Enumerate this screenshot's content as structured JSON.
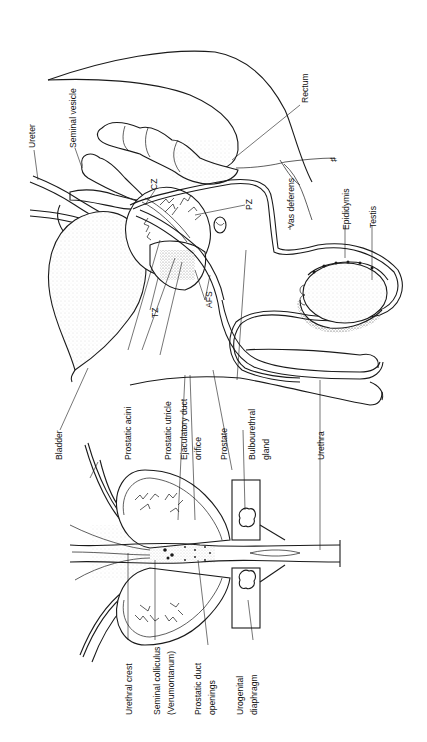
{
  "figure": {
    "orientation_deg": -90,
    "colors": {
      "line": "#1a1a1a",
      "background": "#ffffff",
      "stipple": "#555555"
    }
  },
  "labels": {
    "ureter": "Ureter",
    "seminal_vesicle": "Seminal vesicle",
    "cz": "CZ",
    "pz": "PZ",
    "tz": "TZ",
    "afs": "AFS",
    "rectum": "Rectum",
    "vas_deferens": "Vas deferens",
    "epididymis": "Epididymis",
    "testis": "Testis",
    "bladder": "Bladder",
    "prostatic_acini": "Prostatic acini",
    "prostatic_utricle": "Prostatic utricle",
    "ejaculatory_duct": "Ejaculatory duct",
    "orifice": "orifice",
    "prostate": "Prostate",
    "bulbourethral_1": "Bulbourethral",
    "bulbourethral_2": "gland",
    "urethra": "Urethra",
    "urethral_crest": "Urethral crest",
    "seminal_colliculus_1": "Seminal colliculus",
    "seminal_colliculus_2": "(Verumontanum)",
    "prostatic_duct_1": "Prostatic duct",
    "prostatic_duct_2": "openings",
    "urogenital_1": "Urogenital",
    "urogenital_2": "diaphragm"
  }
}
